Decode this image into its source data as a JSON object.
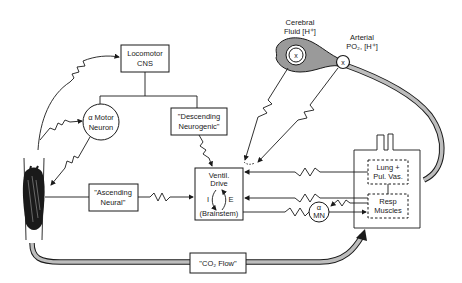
{
  "diagram": {
    "nodes": {
      "locomotor_cns": {
        "line1": "Locomotor",
        "line2": "CNS"
      },
      "alpha_motor_neuron": {
        "line1": "α Motor",
        "line2": "Neuron"
      },
      "descending_neurogenic": {
        "line1": "\"Descending",
        "line2": "Neurogenic\""
      },
      "ascending_neural": {
        "line1": "\"Ascending",
        "line2": "Neural\""
      },
      "ventil_drive": {
        "line1": "Ventil.",
        "line2": "Drive",
        "inspiration": "I",
        "expiration": "E",
        "line3": "(Brainstem)"
      },
      "lung_pul_vas": {
        "line1": "Lung +",
        "line2": "Pul. Vas."
      },
      "resp_muscles": {
        "line1": "Resp",
        "line2": "Muscles"
      },
      "alpha_mn": {
        "line1": "α",
        "line2": "MN"
      },
      "co2_flow": {
        "label": "\"CO₂ Flow\""
      },
      "cerebral_fluid": {
        "line1": "Cerebral",
        "line2": "Fluid [H⁺]",
        "marker": "x"
      },
      "arterial": {
        "line1": "Arterial",
        "line2": "PO₂, [H⁺]",
        "marker": "x"
      }
    },
    "colors": {
      "ink": "#1a1a1a",
      "shading": "#bdbdbd",
      "background": "#ffffff"
    }
  }
}
